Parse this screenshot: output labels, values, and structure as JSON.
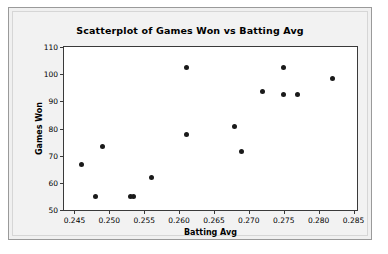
{
  "chart_data": {
    "type": "scatter",
    "title": "Scatterplot of Games Won vs Batting Avg",
    "xlabel": "Batting Avg",
    "ylabel": "Games Won",
    "xlim": [
      0.2435,
      0.2855
    ],
    "ylim": [
      50,
      110
    ],
    "xticks": [
      0.245,
      0.25,
      0.255,
      0.26,
      0.265,
      0.27,
      0.275,
      0.28,
      0.285
    ],
    "xtick_labels": [
      "0.245",
      "0.250",
      "0.255",
      "0.260",
      "0.265",
      "0.270",
      "0.275",
      "0.280",
      "0.285"
    ],
    "yticks": [
      50,
      60,
      70,
      80,
      90,
      100,
      110
    ],
    "ytick_labels": [
      "50",
      "60",
      "70",
      "80",
      "90",
      "100",
      "110"
    ],
    "grid": false,
    "legend": false,
    "marker": "filled-circle",
    "marker_color": "#1a1a1a",
    "series": [
      {
        "name": "Games Won vs Batting Avg",
        "points": [
          {
            "x": 0.246,
            "y": 66.7
          },
          {
            "x": 0.248,
            "y": 54.8
          },
          {
            "x": 0.249,
            "y": 73.5
          },
          {
            "x": 0.253,
            "y": 54.8
          },
          {
            "x": 0.2535,
            "y": 54.8
          },
          {
            "x": 0.256,
            "y": 61.9
          },
          {
            "x": 0.261,
            "y": 102.5
          },
          {
            "x": 0.261,
            "y": 77.8
          },
          {
            "x": 0.268,
            "y": 80.8
          },
          {
            "x": 0.269,
            "y": 71.4
          },
          {
            "x": 0.272,
            "y": 93.5
          },
          {
            "x": 0.275,
            "y": 102.4
          },
          {
            "x": 0.275,
            "y": 92.5
          },
          {
            "x": 0.277,
            "y": 92.5
          },
          {
            "x": 0.282,
            "y": 98.5
          }
        ]
      }
    ]
  },
  "colors": {
    "figure_background": "#f0f0f0",
    "plot_background": "#ffffff",
    "axis": "#3a3a3a",
    "text": "#000000",
    "marker": "#1a1a1a"
  }
}
